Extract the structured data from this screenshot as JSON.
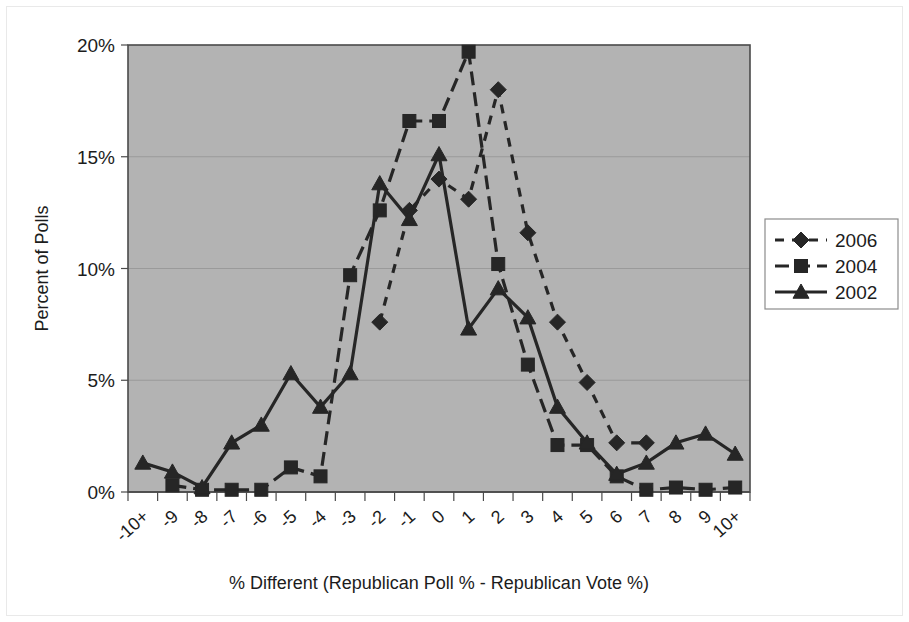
{
  "chart_data": {
    "type": "line",
    "title": "",
    "subtitle": "",
    "xlabel": "% Different (Republican Poll % - Republican Vote %)",
    "ylabel": "Percent of Polls",
    "categories": [
      "-10+",
      "-9",
      "-8",
      "-7",
      "-6",
      "-5",
      "-4",
      "-3",
      "-2",
      "-1",
      "0",
      "1",
      "2",
      "3",
      "4",
      "5",
      "6",
      "7",
      "8",
      "9",
      "10+"
    ],
    "ylim": [
      0,
      20
    ],
    "yticks": [
      0,
      5,
      10,
      15,
      20
    ],
    "ytick_labels": [
      "0%",
      "5%",
      "10%",
      "15%",
      "20%"
    ],
    "grid": true,
    "grid_axis": "y",
    "legend_position": "right",
    "plot_background": "#b3b3b3",
    "series_color": "#262626",
    "series": [
      {
        "name": "2006",
        "marker": "diamond",
        "linestyle": "dotted",
        "values": [
          null,
          null,
          null,
          null,
          null,
          null,
          null,
          null,
          7.6,
          12.6,
          14.0,
          13.1,
          18.0,
          11.6,
          7.6,
          4.9,
          2.2,
          2.2,
          null,
          null,
          null
        ]
      },
      {
        "name": "2004",
        "marker": "square",
        "linestyle": "dashed",
        "values": [
          null,
          0.3,
          0.1,
          0.1,
          0.1,
          1.1,
          0.7,
          9.7,
          12.6,
          16.6,
          16.6,
          19.7,
          10.2,
          5.7,
          2.1,
          2.1,
          0.7,
          0.1,
          0.2,
          0.1,
          0.2
        ]
      },
      {
        "name": "2002",
        "marker": "triangle",
        "linestyle": "solid",
        "values": [
          1.3,
          0.9,
          0.2,
          2.2,
          3.0,
          5.3,
          3.8,
          5.3,
          13.8,
          12.2,
          15.1,
          7.3,
          9.1,
          7.8,
          3.8,
          2.2,
          0.8,
          1.3,
          2.2,
          2.6,
          1.7
        ]
      }
    ]
  },
  "legend": {
    "entries": [
      {
        "label": "2006"
      },
      {
        "label": "2004"
      },
      {
        "label": "2002"
      }
    ]
  },
  "axes": {
    "y_title": "Percent of Polls",
    "x_title": "% Different (Republican Poll % - Republican Vote %)"
  }
}
